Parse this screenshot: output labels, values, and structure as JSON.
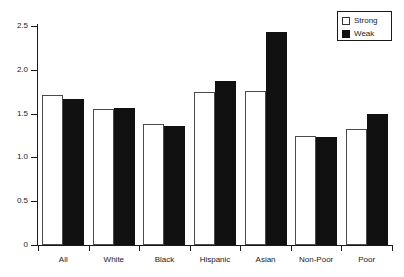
{
  "chart_data": {
    "type": "bar",
    "title": "",
    "xlabel": "",
    "ylabel": "",
    "categories": [
      "All",
      "White",
      "Black",
      "Hispanic",
      "Asian",
      "Non-Poor",
      "Poor"
    ],
    "series": [
      {
        "name": "Strong",
        "color": "#ffffff",
        "values": [
          1.71,
          1.55,
          1.38,
          1.75,
          1.76,
          1.24,
          1.32
        ]
      },
      {
        "name": "Weak",
        "color": "#111111",
        "values": [
          1.67,
          1.56,
          1.36,
          1.87,
          2.43,
          1.23,
          1.49
        ]
      }
    ],
    "ylim": [
      0,
      2.5
    ],
    "ytick_labels": [
      "0",
      "0.5",
      "1.0",
      "1.5",
      "2.0",
      "2.5"
    ],
    "ytick_values": [
      0,
      0.5,
      1.0,
      1.5,
      2.0,
      2.5
    ],
    "grid": false,
    "legend_position": "top-right"
  },
  "legend": {
    "items": [
      {
        "label": "Strong",
        "swatch": "white-square"
      },
      {
        "label": "Weak",
        "swatch": "black-square"
      }
    ]
  },
  "axes": {
    "y_labels": [
      "2.5",
      "2.0",
      "1.5",
      "1.0",
      "0.5",
      "0"
    ],
    "x_labels": [
      "All",
      "White",
      "Black",
      "Hispanic",
      "Asian",
      "Non-Poor",
      "Poor"
    ]
  }
}
